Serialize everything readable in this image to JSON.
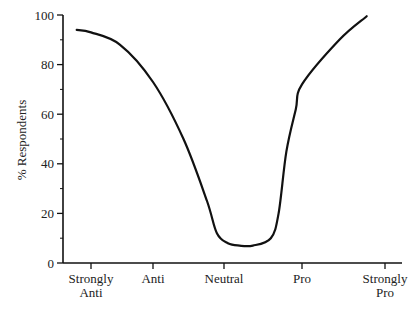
{
  "chart_data": {
    "type": "line",
    "title": "",
    "xlabel": "",
    "ylabel": "% Respondents",
    "ylim": [
      0,
      100
    ],
    "yticks": [
      0,
      20,
      40,
      60,
      80,
      100
    ],
    "categories": [
      "Strongly Anti",
      "Anti",
      "Neutral",
      "Pro",
      "Strongly Pro"
    ],
    "category_label_lines": [
      [
        "Strongly",
        "Anti"
      ],
      [
        "Anti"
      ],
      [
        "Neutral"
      ],
      [
        "Pro"
      ],
      [
        "Strongly",
        "Pro"
      ]
    ],
    "values_at_categories": [
      93,
      73,
      7,
      72,
      100
    ],
    "grid": false,
    "legend": null,
    "series": [
      {
        "name": "% Respondents",
        "description": "U-shaped smooth curve; starts slightly left of Strongly Anti and ends slightly left of Strongly Pro",
        "x": [
          -0.23,
          0,
          0.47,
          1.0,
          1.43,
          1.76,
          1.9,
          2.05,
          2.2,
          2.37,
          2.6,
          2.7,
          2.8,
          2.92,
          3.0,
          3.45,
          3.78
        ],
        "y": [
          94,
          93,
          88,
          73,
          50,
          25,
          12,
          8,
          7,
          7,
          10,
          20,
          45,
          62,
          72,
          90,
          99.5
        ]
      }
    ],
    "color": "#111111"
  }
}
